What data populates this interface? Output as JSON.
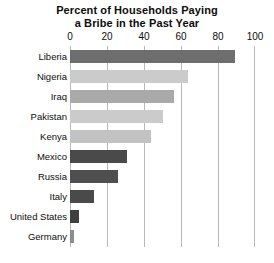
{
  "chart_data": {
    "type": "bar",
    "orientation": "horizontal",
    "title": "Percent of Households Paying a Bribe in the Past Year",
    "title_line1": "Percent of Households Paying",
    "title_line2": "a Bribe in the Past Year",
    "xlabel": "",
    "ylabel": "",
    "xlim": [
      0,
      100
    ],
    "xticks": [
      0,
      20,
      40,
      60,
      80,
      100
    ],
    "xtick_labels": [
      "0",
      "20",
      "40",
      "60",
      "80",
      "100"
    ],
    "grid": true,
    "grid_axis": "x",
    "legend": false,
    "categories": [
      "Liberia",
      "Nigeria",
      "Iraq",
      "Pakistan",
      "Kenya",
      "Mexico",
      "Russia",
      "Italy",
      "United States",
      "Germany"
    ],
    "values": [
      89,
      64,
      56,
      50,
      44,
      31,
      26,
      13,
      5,
      2
    ],
    "bar_colors": [
      "#6e6e6e",
      "#cbcbcb",
      "#a9a9a9",
      "#cbcbcb",
      "#c2c2c2",
      "#4a4a4a",
      "#4f4f4f",
      "#4a4a4a",
      "#3f3f3f",
      "#8c8c8c"
    ]
  },
  "colors": {
    "background": "#ffffff",
    "text": "#0d0d0d",
    "gridline": "#b9b9b9"
  }
}
